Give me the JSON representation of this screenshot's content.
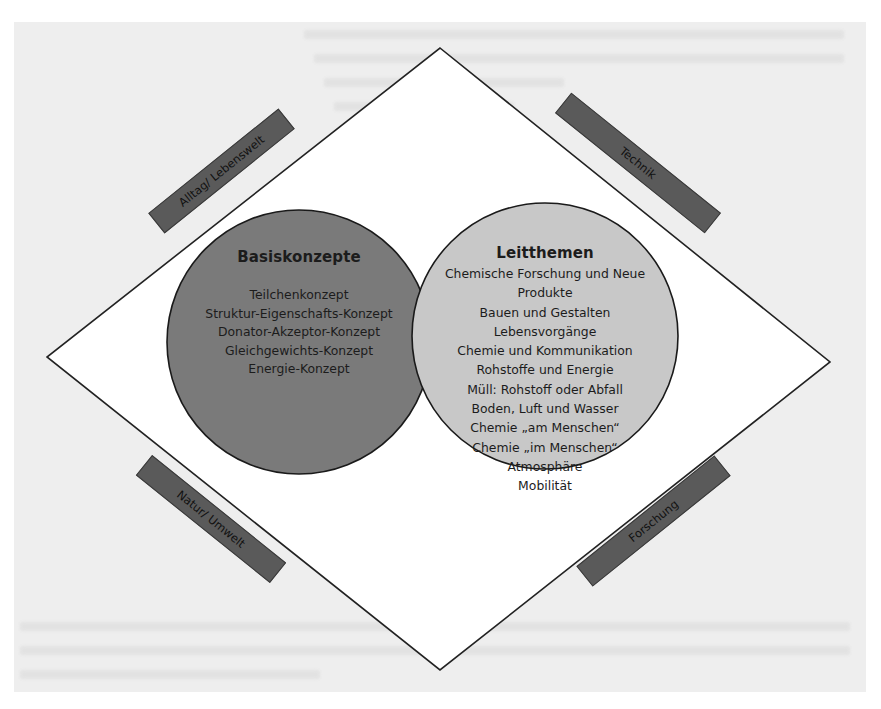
{
  "figure": {
    "type": "concept-diagram",
    "shape": "diamond-with-two-overlapping-circles",
    "colors": {
      "page_background": "#eeeeee",
      "diamond_fill": "#ffffff",
      "diamond_stroke": "#222222",
      "left_circle_fill": "#7a7a7a",
      "right_circle_fill": "#c8c8c8",
      "circle_stroke": "#1a1a1a",
      "band_fill": "#5a5a5a",
      "text": "#1c1c1c"
    }
  },
  "left_circle": {
    "title": "Basiskonzepte",
    "items": [
      "Teilchenkonzept",
      "Struktur-Eigenschafts-Konzept",
      "Donator-Akzeptor-Konzept",
      "Gleichgewichts-Konzept",
      "Energie-Konzept"
    ]
  },
  "right_circle": {
    "title": "Leitthemen",
    "items": [
      "Chemische Forschung und Neue",
      "Produkte",
      "Bauen und Gestalten",
      "Lebensvorgänge",
      "Chemie und Kommunikation",
      "Rohstoffe und Energie",
      "Müll: Rohstoff oder Abfall",
      "Boden, Luft und Wasser",
      "Chemie „am Menschen“",
      "Chemie „im Menschen“",
      "Atmosphäre",
      "Mobilität"
    ]
  },
  "side_bands": {
    "top_left": "Alltag/ Lebenswelt",
    "top_right": "Technik",
    "bottom_left": "Natur/ Umwelt",
    "bottom_right": "Forschung"
  }
}
